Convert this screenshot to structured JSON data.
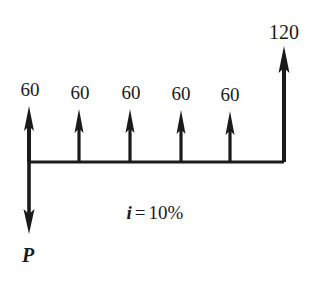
{
  "diagram": {
    "type": "cash-flow-diagram",
    "background_color": "#ffffff",
    "stroke_color": "#1a1a1a",
    "timeline": {
      "y": 162,
      "x_start": 29,
      "x_end": 284
    },
    "interest_rate": {
      "symbol": "i",
      "equals": "=",
      "value": "10%",
      "full_text": "i = 10%",
      "x": 155,
      "y": 218
    },
    "present_value": {
      "label": "P",
      "direction": "down",
      "x": 29,
      "tip_y": 233,
      "label_y": 261
    },
    "inflows": [
      {
        "label": "60",
        "x": 29,
        "tip_y": 108,
        "label_y": 80,
        "shaft_width": 4
      },
      {
        "label": "60",
        "x": 79,
        "tip_y": 111,
        "label_y": 83,
        "shaft_width": 3
      },
      {
        "label": "60",
        "x": 130,
        "tip_y": 111,
        "label_y": 83,
        "shaft_width": 3
      },
      {
        "label": "60",
        "x": 181,
        "tip_y": 112,
        "label_y": 84,
        "shaft_width": 3
      },
      {
        "label": "60",
        "x": 230,
        "tip_y": 113,
        "label_y": 85,
        "shaft_width": 3
      }
    ],
    "final_inflow": {
      "label": "120",
      "x": 284,
      "tip_y": 48,
      "label_y": 22,
      "shaft_width": 4
    }
  }
}
